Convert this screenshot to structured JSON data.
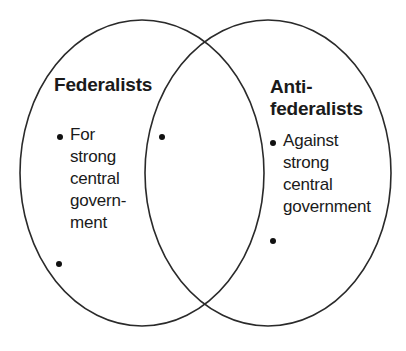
{
  "diagram": {
    "type": "venn",
    "left_set": {
      "title": "Federalists",
      "items": [
        {
          "lines": [
            "For",
            "strong",
            "central",
            "govern-",
            "ment"
          ]
        },
        {
          "lines": [
            ""
          ]
        }
      ]
    },
    "overlap": {
      "items": [
        {
          "lines": [
            ""
          ]
        }
      ]
    },
    "right_set": {
      "title_lines": [
        "Anti-",
        "federalists"
      ],
      "items": [
        {
          "lines": [
            "Against",
            "strong",
            "central",
            "government"
          ]
        },
        {
          "lines": [
            ""
          ]
        }
      ]
    },
    "colors": {
      "stroke": "#2a2a2a",
      "text": "#1a1a1a",
      "background": "#ffffff"
    }
  }
}
